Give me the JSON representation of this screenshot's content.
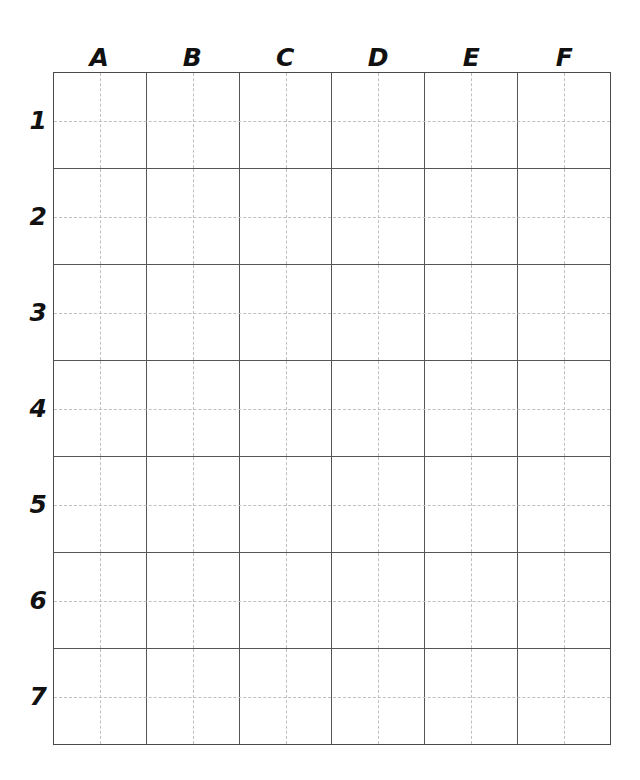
{
  "sheet": {
    "title": "Blank coordinate grid worksheet",
    "background_color": "#ffffff",
    "line_color": "#555555",
    "guide_line_color": "#bfbfbf",
    "label_color": "#111111"
  },
  "grid": {
    "columns": 6,
    "rows": 7,
    "column_labels": [
      "A",
      "B",
      "C",
      "D",
      "E",
      "F"
    ],
    "row_labels": [
      "1",
      "2",
      "3",
      "4",
      "5",
      "6",
      "7"
    ],
    "cell_subdivision": "half",
    "cells": [
      [
        "",
        "",
        "",
        "",
        "",
        ""
      ],
      [
        "",
        "",
        "",
        "",
        "",
        ""
      ],
      [
        "",
        "",
        "",
        "",
        "",
        ""
      ],
      [
        "",
        "",
        "",
        "",
        "",
        ""
      ],
      [
        "",
        "",
        "",
        "",
        "",
        ""
      ],
      [
        "",
        "",
        "",
        "",
        "",
        ""
      ],
      [
        "",
        "",
        "",
        "",
        "",
        ""
      ]
    ]
  }
}
